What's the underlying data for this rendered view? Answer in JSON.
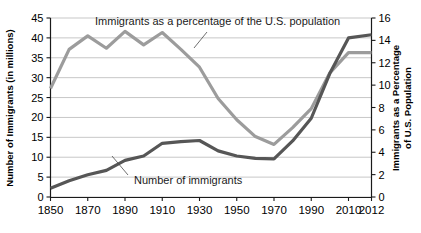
{
  "chart_data": {
    "type": "line",
    "title": "",
    "xlabel": "",
    "ylabel": "Number of Immigrants (in millions)",
    "y2label": "Immigrants as a Percentage of U.S. Population",
    "grid": true,
    "legend_position": "inline-annotations",
    "x": [
      1850,
      1860,
      1870,
      1880,
      1890,
      1900,
      1910,
      1920,
      1930,
      1940,
      1950,
      1960,
      1970,
      1980,
      1990,
      2000,
      2010,
      2012
    ],
    "x_tick_labels": [
      "1850",
      "1870",
      "1890",
      "1910",
      "1930",
      "1950",
      "1970",
      "1990",
      "2010",
      "2012"
    ],
    "x_tick_values": [
      1850,
      1870,
      1890,
      1910,
      1930,
      1950,
      1970,
      1990,
      2010,
      2012
    ],
    "ylim": [
      0,
      45
    ],
    "y_ticks": [
      0,
      5,
      10,
      15,
      20,
      25,
      30,
      35,
      40,
      45
    ],
    "y_tick_labels": [
      "0",
      "5",
      "10",
      "15",
      "20",
      "25",
      "30",
      "35",
      "40",
      "45"
    ],
    "y2lim": [
      0,
      16
    ],
    "y2_ticks": [
      0,
      2,
      4,
      6,
      8,
      10,
      12,
      14,
      16
    ],
    "y2_tick_labels": [
      "0",
      "2",
      "4",
      "6",
      "8",
      "10",
      "12",
      "14",
      "16"
    ],
    "series": [
      {
        "name": "Number of immigrants",
        "axis": "left",
        "unit": "millions",
        "color": "#565656",
        "values": [
          2.2,
          4.1,
          5.6,
          6.7,
          9.2,
          10.3,
          13.5,
          13.9,
          14.2,
          11.6,
          10.3,
          9.7,
          9.6,
          14.1,
          19.8,
          31.1,
          40.0,
          40.8
        ]
      },
      {
        "name": "Immigrants as a percentage of the U.S. population",
        "axis": "right",
        "unit": "percent",
        "color": "#9c9c9c",
        "values": [
          9.7,
          13.2,
          14.4,
          13.3,
          14.8,
          13.6,
          14.7,
          13.2,
          11.6,
          8.8,
          6.9,
          5.4,
          4.7,
          6.2,
          7.9,
          11.1,
          12.9,
          12.9
        ]
      }
    ],
    "annotations": [
      {
        "name": "percentage-annotation",
        "text": "Immigrants as a percentage of the U.S. population",
        "series": "Immigrants as a percentage of the U.S. population"
      },
      {
        "name": "number-annotation",
        "text": "Number of immigrants",
        "series": "Number of immigrants"
      }
    ],
    "colors": {
      "number_of_immigrants": "#565656",
      "percentage_of_population": "#9c9c9c",
      "gridline": "#b9b9b9",
      "axis": "#1a1a1a",
      "background": "#ffffff"
    }
  }
}
